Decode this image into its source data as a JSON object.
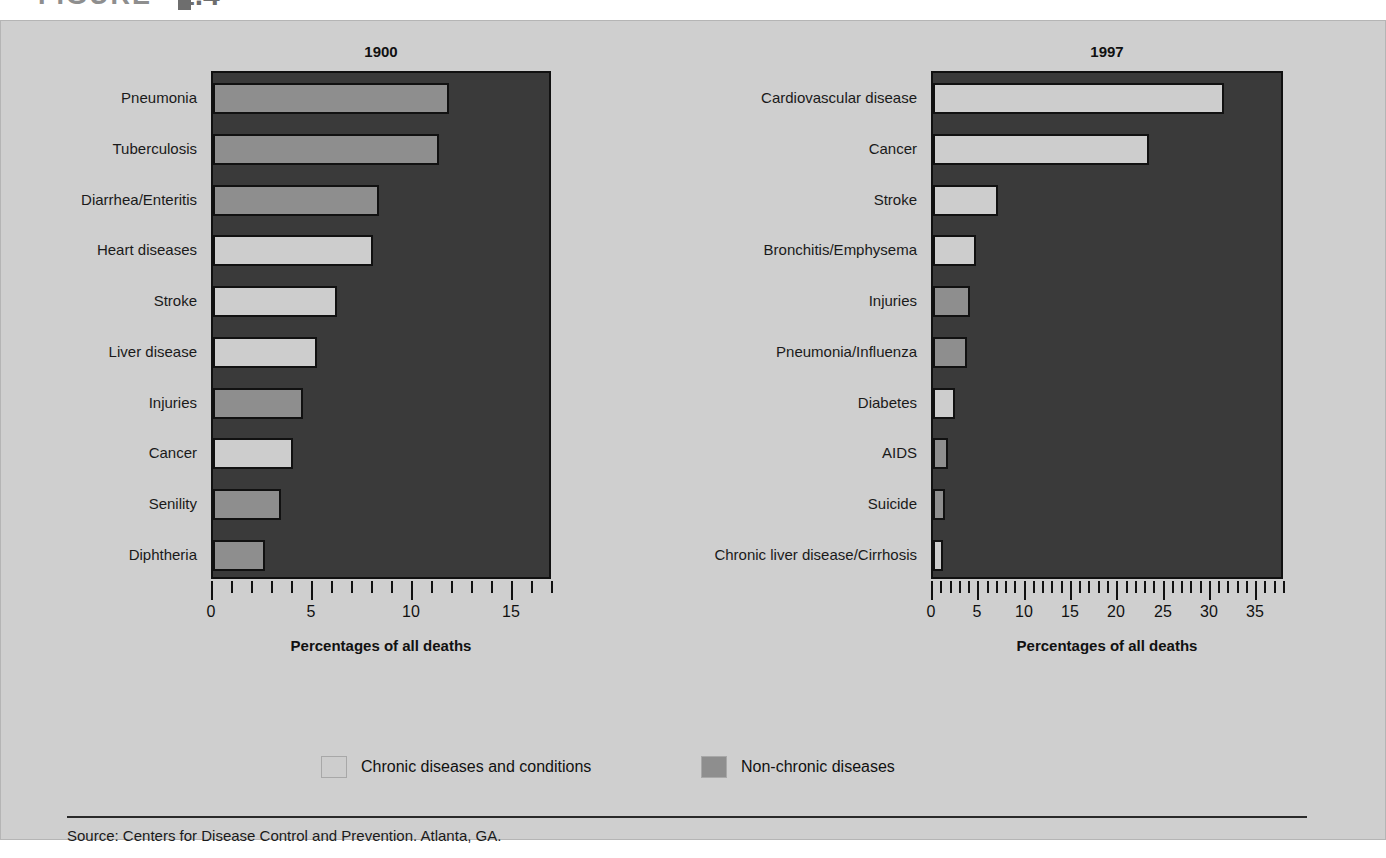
{
  "figure": {
    "label": "FIGURE",
    "number": "1.4",
    "caption": "Leading causes of death: United States, 1900 and 1997"
  },
  "legend": {
    "chronic_label": "Chronic diseases and conditions",
    "nonchronic_label": "Non-chronic diseases",
    "chronic_color": "#cdcdcd",
    "nonchronic_color": "#8e8e8e"
  },
  "source": {
    "text": "Source: Centers for Disease Control and Prevention. Atlanta, GA."
  },
  "axis": {
    "title": "Percentages of all deaths"
  },
  "chart_data": [
    {
      "type": "bar",
      "orientation": "horizontal",
      "title": "1900",
      "xlabel": "Percentages of all deaths",
      "ylabel": "",
      "xlim": [
        0,
        17
      ],
      "xticks": [
        0,
        5,
        10,
        15
      ],
      "xtick_labels": [
        "0",
        "5",
        "10",
        "15"
      ],
      "minor_tick_step": 1,
      "grid": false,
      "legend_position": "bottom",
      "categories": [
        "Pneumonia",
        "Tuberculosis",
        "Diarrhea/Enteritis",
        "Heart diseases",
        "Stroke",
        "Liver disease",
        "Injuries",
        "Cancer",
        "Senility",
        "Diphtheria"
      ],
      "values": [
        11.8,
        11.3,
        8.3,
        8.0,
        6.2,
        5.2,
        4.5,
        4.0,
        3.4,
        2.6
      ],
      "series_class": [
        "nonchronic",
        "nonchronic",
        "nonchronic",
        "chronic",
        "chronic",
        "chronic",
        "nonchronic",
        "chronic",
        "nonchronic",
        "nonchronic"
      ]
    },
    {
      "type": "bar",
      "orientation": "horizontal",
      "title": "1997",
      "xlabel": "Percentages of all deaths",
      "ylabel": "",
      "xlim": [
        0,
        38
      ],
      "xticks": [
        0,
        5,
        10,
        15,
        20,
        25,
        30,
        35
      ],
      "xtick_labels": [
        "0",
        "5",
        "10",
        "15",
        "20",
        "25",
        "30",
        "35"
      ],
      "minor_tick_step": 1,
      "grid": false,
      "legend_position": "bottom",
      "categories": [
        "Cardiovascular disease",
        "Cancer",
        "Stroke",
        "Bronchitis/Emphysema",
        "Injuries",
        "Pneumonia/Influenza",
        "Diabetes",
        "AIDS",
        "Suicide",
        "Chronic liver disease/Cirrhosis"
      ],
      "values": [
        31.4,
        23.3,
        7.0,
        4.6,
        4.0,
        3.7,
        2.4,
        1.6,
        1.3,
        1.1
      ],
      "series_class": [
        "chronic",
        "chronic",
        "chronic",
        "chronic",
        "nonchronic",
        "nonchronic",
        "chronic",
        "nonchronic",
        "nonchronic",
        "chronic"
      ]
    }
  ]
}
